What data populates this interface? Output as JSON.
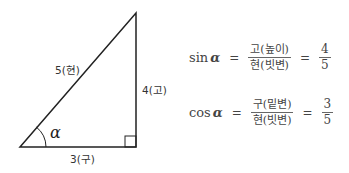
{
  "triangle": {
    "hypotenuse_label": "5(현)",
    "height_label": "4(고)",
    "base_label": "3(구)",
    "angle_label": "α"
  },
  "formulas": [
    {
      "fn": "sin",
      "angle": "α",
      "equals": "=",
      "num": "고(높이)",
      "den": "현(빗변)",
      "equals2": "=",
      "value_num": "4",
      "value_den": "5"
    },
    {
      "fn": "cos",
      "angle": "α",
      "equals": "=",
      "num": "구(밑변)",
      "den": "현(빗변)",
      "equals2": "=",
      "value_num": "3",
      "value_den": "5"
    }
  ]
}
